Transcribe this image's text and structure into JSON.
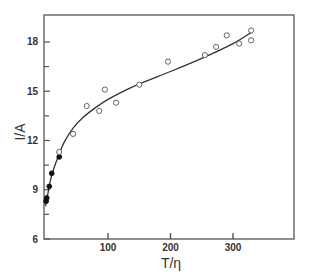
{
  "chart_data": {
    "type": "scatter",
    "title": "",
    "xlabel": "T/η",
    "ylabel": "I/A",
    "xlim": [
      0,
      400
    ],
    "ylim": [
      6,
      19.6
    ],
    "x_ticks": [
      100,
      200,
      300
    ],
    "x_tick_labels": [
      "100",
      "200",
      "300"
    ],
    "y_ticks": [
      6,
      9,
      12,
      15,
      18
    ],
    "y_tick_labels": [
      "6",
      "9",
      "12",
      "15",
      "18"
    ],
    "y_minor_ticks": [
      7.5,
      10.5,
      13.5,
      16.5
    ],
    "grid": false,
    "legend": null,
    "series": [
      {
        "name": "filled",
        "marker": "filled-circle",
        "points": [
          [
            1,
            8.3
          ],
          [
            2,
            8.5
          ],
          [
            6,
            9.2
          ],
          [
            10,
            10.0
          ],
          [
            22,
            11.0
          ]
        ]
      },
      {
        "name": "open",
        "marker": "open-circle",
        "points": [
          [
            22,
            11.3
          ],
          [
            44,
            12.4
          ],
          [
            66,
            14.1
          ],
          [
            86,
            13.8
          ],
          [
            95,
            15.1
          ],
          [
            113,
            14.3
          ],
          [
            150,
            15.4
          ],
          [
            196,
            16.8
          ],
          [
            255,
            17.2
          ],
          [
            273,
            17.7
          ],
          [
            290,
            18.4
          ],
          [
            310,
            17.9
          ],
          [
            329,
            18.7
          ],
          [
            329,
            18.1
          ]
        ]
      },
      {
        "name": "fit",
        "marker": "line",
        "points": [
          [
            0,
            8.0
          ],
          [
            5,
            9.0
          ],
          [
            10,
            9.9
          ],
          [
            20,
            11.0
          ],
          [
            30,
            11.9
          ],
          [
            45,
            12.8
          ],
          [
            60,
            13.4
          ],
          [
            80,
            14.0
          ],
          [
            100,
            14.5
          ],
          [
            130,
            15.1
          ],
          [
            160,
            15.6
          ],
          [
            200,
            16.2
          ],
          [
            250,
            17.0
          ],
          [
            300,
            17.9
          ],
          [
            330,
            18.6
          ]
        ]
      }
    ]
  }
}
